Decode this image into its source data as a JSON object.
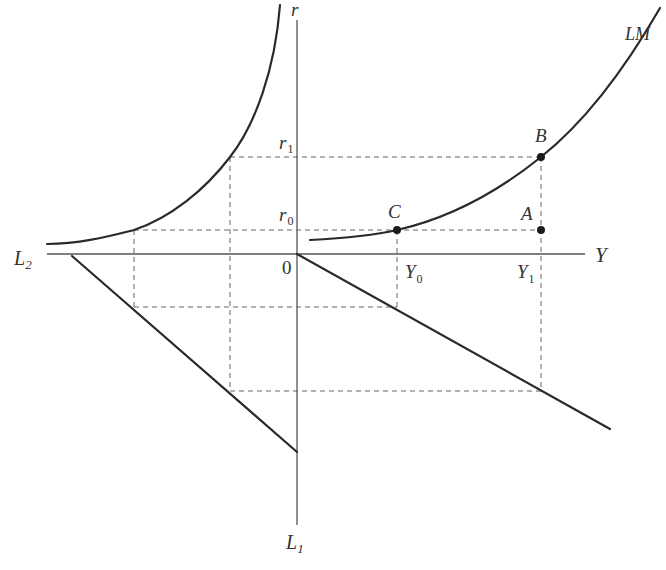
{
  "diagram": {
    "type": "four-quadrant LM derivation",
    "colors": {
      "curve": "#2a2a2a",
      "axis": "#555555",
      "dashed": "#666666",
      "text": "#333333"
    },
    "axes": {
      "vertical_top_label": "r",
      "vertical_bottom_label": "L",
      "vertical_bottom_sub": "1",
      "horizontal_right_label": "Y",
      "horizontal_left_label": "L",
      "horizontal_left_sub": "2",
      "origin_label": "0"
    },
    "ticks": {
      "r1": {
        "main": "r",
        "sub": "1"
      },
      "r0": {
        "main": "r",
        "sub": "0"
      },
      "Y0": {
        "main": "Y",
        "sub": "0"
      },
      "Y1": {
        "main": "Y",
        "sub": "1"
      }
    },
    "curves": {
      "lm_label": "LM"
    },
    "points": {
      "A": "A",
      "B": "B",
      "C": "C"
    }
  }
}
